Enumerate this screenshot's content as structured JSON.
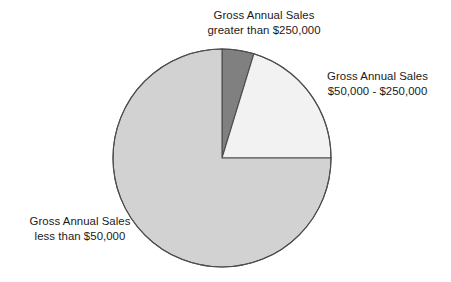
{
  "chart_data": {
    "type": "pie",
    "title": "",
    "subtitle": "",
    "xlabel": "",
    "ylabel": "",
    "legend_position": "labels-outside",
    "grid": false,
    "start_angle_deg": 0,
    "direction": "clockwise",
    "center": {
      "x": 222,
      "y": 158
    },
    "radius": 109,
    "categories": [
      "Gross Annual Sales greater than $250,000",
      "Gross Annual Sales $50,000 - $250,000",
      "Gross Annual Sales less than $50,000"
    ],
    "values": [
      4.7,
      20.3,
      75.0
    ],
    "slices": [
      {
        "key": "greater-than-250k",
        "label_line1": "Gross Annual Sales",
        "label_line2": "greater than $250,000",
        "value": 4.7,
        "start_deg": 0,
        "end_deg": 17,
        "color": "#808080",
        "stroke": "#4d4d4d"
      },
      {
        "key": "50k-to-250k",
        "label_line1": "Gross Annual Sales",
        "label_line2": "$50,000 - $250,000",
        "value": 20.3,
        "start_deg": 17,
        "end_deg": 90,
        "color": "#f2f2f2",
        "stroke": "#4d4d4d"
      },
      {
        "key": "less-than-50k",
        "label_line1": "Gross Annual Sales",
        "label_line2": "less than $50,000",
        "value": 75.0,
        "start_deg": 90,
        "end_deg": 360,
        "color": "#d2d2d2",
        "stroke": "#4d4d4d"
      }
    ]
  },
  "labels": {
    "top": {
      "line1": "Gross Annual Sales",
      "line2": "greater than $250,000"
    },
    "right": {
      "line1": "Gross Annual Sales",
      "line2": "$50,000 - $250,000"
    },
    "left": {
      "line1": "Gross Annual Sales",
      "line2": "less than $50,000"
    }
  },
  "colors": {
    "background": "#ffffff",
    "text": "#1a1a1a",
    "slice_dark": "#808080",
    "slice_light": "#f2f2f2",
    "slice_gray": "#d2d2d2",
    "outline": "#4d4d4d"
  }
}
